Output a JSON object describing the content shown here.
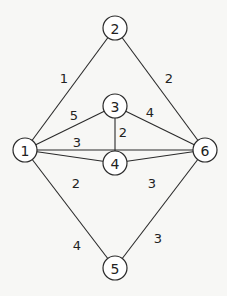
{
  "graph": {
    "type": "weighted-undirected-graph",
    "node_radius": 12,
    "nodes": [
      {
        "id": "1",
        "label": "1",
        "x": 25,
        "y": 150
      },
      {
        "id": "2",
        "label": "2",
        "x": 115,
        "y": 28
      },
      {
        "id": "3",
        "label": "3",
        "x": 115,
        "y": 106
      },
      {
        "id": "4",
        "label": "4",
        "x": 115,
        "y": 163
      },
      {
        "id": "5",
        "label": "5",
        "x": 115,
        "y": 268
      },
      {
        "id": "6",
        "label": "6",
        "x": 205,
        "y": 150
      }
    ],
    "edges": [
      {
        "from": "1",
        "to": "2",
        "weight": "1",
        "label_x": 64,
        "label_y": 78
      },
      {
        "from": "2",
        "to": "6",
        "weight": "2",
        "label_x": 169,
        "label_y": 78
      },
      {
        "from": "1",
        "to": "3",
        "weight": "5",
        "label_x": 74,
        "label_y": 115
      },
      {
        "from": "3",
        "to": "6",
        "weight": "4",
        "label_x": 150,
        "label_y": 112
      },
      {
        "from": "1",
        "to": "6",
        "weight": "3",
        "label_x": 77,
        "label_y": 142
      },
      {
        "from": "3",
        "to": "4",
        "weight": "2",
        "label_x": 123,
        "label_y": 132
      },
      {
        "from": "1",
        "to": "4",
        "weight": "2",
        "label_x": 76,
        "label_y": 183
      },
      {
        "from": "4",
        "to": "6",
        "weight": "3",
        "label_x": 152,
        "label_y": 183
      },
      {
        "from": "1",
        "to": "5",
        "weight": "4",
        "label_x": 77,
        "label_y": 245
      },
      {
        "from": "6",
        "to": "5",
        "weight": "3",
        "label_x": 158,
        "label_y": 238
      }
    ]
  }
}
